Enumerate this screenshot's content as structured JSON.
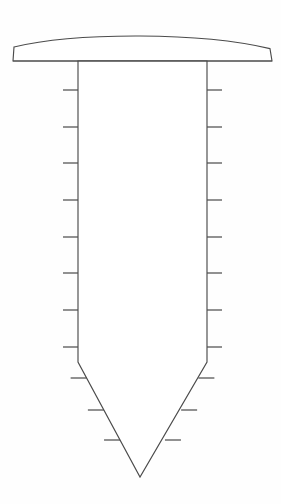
{
  "figure": {
    "view": "front-elevation",
    "background_color": "#fefefe",
    "line_color": "#4b4b4b",
    "fill_color": "#ffffff",
    "canvas": {
      "width": 281,
      "height": 504
    }
  },
  "head": {
    "label": "Domed flat-bottom head",
    "left_x": 13,
    "right_x": 272,
    "top_apex_y": 36,
    "shoulder_y": 47,
    "bottom_y": 61,
    "width": 259,
    "height": 25,
    "profile": "curved crown with straight flat underside"
  },
  "shank": {
    "label": "Parallel shank",
    "left_x": 78,
    "right_x": 207,
    "top_y": 61,
    "bottom_y": 362,
    "width": 129,
    "length": 301
  },
  "point": {
    "label": "Diamond V point",
    "apex_x": 140,
    "apex_y": 477,
    "start_y": 362,
    "length": 115
  },
  "threads": {
    "label": "Annular thread barbs",
    "left_count": 9,
    "right_count": 9,
    "taper_left_count": 4,
    "taper_right_count": 4,
    "shank_tick_length": 15,
    "taper_tick_length": 16,
    "shank_tick_y": [
      90,
      127,
      163,
      200,
      237,
      273,
      310,
      347
    ],
    "taper_tick_y": [
      378,
      410,
      440
    ],
    "spacing_px": 36.5
  },
  "geometry": {
    "head_path": "M 13 61 L 14 47 Q 75 35 140 36 Q 205 37 270 49 L 272 61 Z",
    "body_path": "M 78 61 L 78 362 L 140 477 L 207 362 L 207 61 Z"
  }
}
